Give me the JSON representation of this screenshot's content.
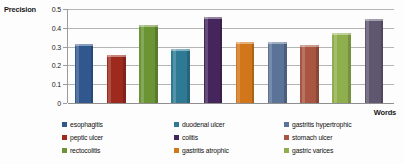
{
  "chart_data": {
    "type": "bar",
    "title": "",
    "ylabel": "Precision",
    "xlabel": "Words",
    "ylim": [
      0,
      0.5
    ],
    "ytick_labels": [
      "0.5",
      "0.4",
      "0.3",
      "0.2",
      "0.1",
      "0"
    ],
    "ytick_values": [
      0.5,
      0.4,
      0.3,
      0.2,
      0.1,
      0
    ],
    "grid": true,
    "legend_position": "bottom",
    "categories": [
      "esophagitis",
      "peptic ulcer",
      "rectocolitis",
      "duodenal ulcer",
      "colitis",
      "gastritis  atrophic",
      "gastritis hypertrophic",
      "stomach ulcer",
      "gastric varices",
      "gastric ulcer"
    ],
    "values": [
      0.315,
      0.255,
      0.415,
      0.285,
      0.455,
      0.325,
      0.325,
      0.308,
      0.375,
      0.445
    ],
    "colors": [
      "#31578F",
      "#9E2A1E",
      "#6B9534",
      "#2E7A94",
      "#45265C",
      "#D2761B",
      "#5B7396",
      "#A85642",
      "#8FAF4E",
      "#5F5670"
    ]
  },
  "legend": {
    "entries": [
      {
        "label": "esophagitis",
        "color": "#31578F"
      },
      {
        "label": "peptic ulcer",
        "color": "#9E2A1E"
      },
      {
        "label": "rectocolitis",
        "color": "#6B9534"
      },
      {
        "label": "duodenal ulcer",
        "color": "#2E7A94"
      },
      {
        "label": "colitis",
        "color": "#45265C"
      },
      {
        "label": "gastritis  atrophic",
        "color": "#D2761B"
      },
      {
        "label": "gastritis hypertrophic",
        "color": "#5B7396"
      },
      {
        "label": "stomach ulcer",
        "color": "#A85642"
      },
      {
        "label": "gastric varices",
        "color": "#8FAF4E"
      }
    ]
  }
}
